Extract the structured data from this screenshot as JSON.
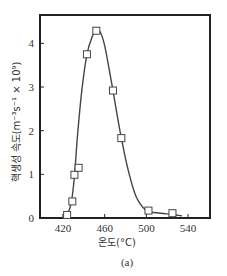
{
  "chart_data": {
    "type": "line",
    "title": "",
    "caption": "(a)",
    "xlabel": "온도(°C)",
    "ylabel": "핵생성 속도(m⁻³s⁻¹ × 10⁹)",
    "xlim": [
      398,
      561
    ],
    "ylim": [
      0,
      4.65
    ],
    "xticks": [
      420,
      460,
      500,
      540
    ],
    "yticks": [
      0,
      1,
      2,
      3,
      4
    ],
    "grid": false,
    "legend": null,
    "series": [
      {
        "name": "measured",
        "marker": "square-open",
        "x": [
          424,
          429,
          431,
          435,
          443,
          452,
          468,
          476,
          502,
          525
        ],
        "y": [
          0.07,
          0.38,
          0.99,
          1.15,
          3.75,
          4.29,
          2.92,
          1.83,
          0.17,
          0.11
        ]
      },
      {
        "name": "fit-curve",
        "marker": "none",
        "x": [
          420,
          424,
          428,
          431,
          434,
          438,
          443,
          448,
          452,
          456,
          460,
          464,
          468,
          472,
          476,
          482,
          490,
          500,
          510,
          525,
          534
        ],
        "y": [
          0.0,
          0.07,
          0.35,
          0.95,
          1.9,
          2.9,
          3.75,
          4.15,
          4.3,
          4.25,
          3.95,
          3.45,
          2.92,
          2.35,
          1.83,
          1.15,
          0.5,
          0.17,
          0.12,
          0.08,
          0.05
        ]
      }
    ]
  }
}
